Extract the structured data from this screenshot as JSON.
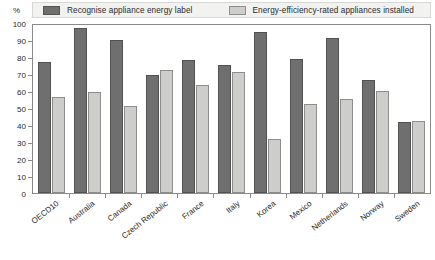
{
  "axis": {
    "unit_label": "%",
    "y_ticks": [
      0,
      10,
      20,
      30,
      40,
      50,
      60,
      70,
      80,
      90,
      100
    ]
  },
  "legend": {
    "series1_label": "Recognise appliance energy label",
    "series2_label": "Energy-efficiency-rated appliances installed",
    "series1_color": "#706f6f",
    "series2_color": "#cdcdcb"
  },
  "chart_data": {
    "type": "bar",
    "title": "",
    "subtitle": "",
    "xlabel": "",
    "ylabel": "%",
    "ylim": [
      0,
      100
    ],
    "ytick_step": 10,
    "grid": false,
    "legend_position": "top",
    "categories": [
      "OECD10",
      "Australia",
      "Canada",
      "Czech Republic",
      "France",
      "Italy",
      "Korea",
      "Mexico",
      "Netherlands",
      "Norway",
      "Sweden"
    ],
    "series": [
      {
        "name": "Recognise appliance energy label",
        "color": "#706f6f",
        "values": [
          78,
          98,
          91,
          70,
          79,
          76,
          96,
          80,
          92,
          67,
          42
        ]
      },
      {
        "name": "Energy-efficiency-rated appliances installed",
        "color": "#cdcdcb",
        "values": [
          57,
          60,
          52,
          73,
          64,
          72,
          32,
          53,
          56,
          61,
          43
        ]
      }
    ]
  }
}
